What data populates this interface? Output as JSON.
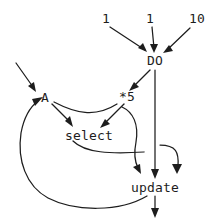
{
  "diagram": {
    "background_color": "#ffffff",
    "ink_color": "#1d1d1d",
    "nodes": [
      {
        "id": "lit_1_a",
        "label": "1",
        "kind": "literal",
        "x": 106,
        "y": 18
      },
      {
        "id": "lit_1_b",
        "label": "1",
        "kind": "literal",
        "x": 150,
        "y": 18
      },
      {
        "id": "lit_10",
        "label": "10",
        "kind": "literal",
        "x": 197,
        "y": 18
      },
      {
        "id": "do",
        "label": "DO",
        "kind": "operator",
        "x": 155,
        "y": 60
      },
      {
        "id": "mul5",
        "label": "*5",
        "kind": "operator",
        "x": 127,
        "y": 96
      },
      {
        "id": "a",
        "label": "A",
        "kind": "variable",
        "x": 45,
        "y": 97
      },
      {
        "id": "select",
        "label": "select",
        "kind": "operator",
        "x": 89,
        "y": 135
      },
      {
        "id": "update",
        "label": "update",
        "kind": "operator",
        "x": 155,
        "y": 187
      }
    ],
    "edges": [
      {
        "id": "e1",
        "from": "lit_1_a",
        "to": "do",
        "style": "straight"
      },
      {
        "id": "e2",
        "from": "lit_1_b",
        "to": "do",
        "style": "straight"
      },
      {
        "id": "e3",
        "from": "lit_10",
        "to": "do",
        "style": "straight"
      },
      {
        "id": "e4",
        "from": "do",
        "to": "mul5",
        "style": "straight"
      },
      {
        "id": "e5",
        "from": "do",
        "to": "update",
        "style": "straight"
      },
      {
        "id": "e6",
        "from": "external-input",
        "to": "a",
        "style": "straight"
      },
      {
        "id": "e7",
        "from": "a",
        "to": "select",
        "style": "straight"
      },
      {
        "id": "e8",
        "from": "a",
        "to": "mul5",
        "style": "curved"
      },
      {
        "id": "e9",
        "from": "mul5",
        "to": "select",
        "style": "straight"
      },
      {
        "id": "e10",
        "from": "mul5",
        "to": "update",
        "style": "curved"
      },
      {
        "id": "e11",
        "from": "select",
        "to": "update",
        "style": "curved"
      },
      {
        "id": "e12",
        "from": "update",
        "to": "a",
        "style": "feedback-loop"
      },
      {
        "id": "e13",
        "from": "update",
        "to": "external-output",
        "style": "straight"
      }
    ]
  }
}
